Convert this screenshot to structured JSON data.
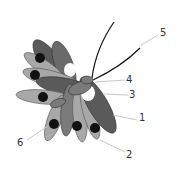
{
  "diagram": {
    "labels": [
      {
        "id": "1",
        "text": "1"
      },
      {
        "id": "2",
        "text": "2"
      },
      {
        "id": "3",
        "text": "3"
      },
      {
        "id": "4",
        "text": "4"
      },
      {
        "id": "5",
        "text": "5"
      },
      {
        "id": "6",
        "text": "6"
      }
    ],
    "colors": {
      "dark_petal": "#5a5a5a",
      "light_petal": "#a8a8a8",
      "mid_petal": "#7a7a7a",
      "knot": "#111111",
      "leader_line": "#c8c8c8",
      "filament": "#111111",
      "highlight": "#ffffff"
    }
  }
}
